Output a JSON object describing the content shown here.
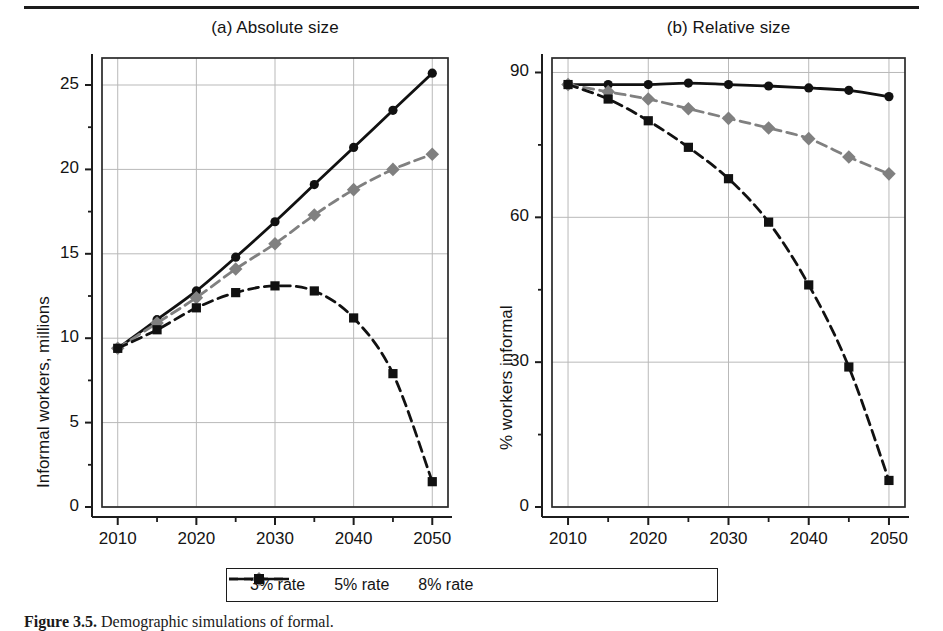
{
  "figure": {
    "caption_prefix": "Figure 3.5.",
    "caption_text": "Demographic simulations of formal."
  },
  "legend": {
    "items": [
      {
        "label": "3% rate",
        "style": "solid",
        "marker": "circle",
        "color": "#111111"
      },
      {
        "label": "5% rate",
        "style": "dashed",
        "marker": "diamond",
        "color": "#808080"
      },
      {
        "label": "8% rate",
        "style": "dashed",
        "marker": "square",
        "color": "#111111"
      }
    ]
  },
  "chart_data": [
    {
      "type": "line",
      "panel": "a",
      "title": "(a) Absolute size",
      "xlabel": "",
      "ylabel": "Informal workers, millions",
      "x": [
        2010,
        2015,
        2020,
        2025,
        2030,
        2035,
        2040,
        2045,
        2050
      ],
      "xticks": [
        "2010",
        "2020",
        "2030",
        "2040",
        "2050"
      ],
      "xtick_values": [
        2010,
        2020,
        2030,
        2040,
        2050
      ],
      "yticks": [
        "0",
        "5",
        "10",
        "15",
        "20",
        "25"
      ],
      "ytick_values": [
        0,
        5,
        10,
        15,
        20,
        25
      ],
      "xlim": [
        2008,
        2052
      ],
      "ylim": [
        0,
        26.6
      ],
      "grid": true,
      "legend_position": "below",
      "series": [
        {
          "name": "3% rate",
          "marker": "circle",
          "style": "solid",
          "color": "#111111",
          "values": [
            9.4,
            11.1,
            12.8,
            14.8,
            16.9,
            19.1,
            21.3,
            23.5,
            25.7
          ]
        },
        {
          "name": "5% rate",
          "marker": "diamond",
          "style": "dashed",
          "color": "#808080",
          "values": [
            9.4,
            10.9,
            12.4,
            14.1,
            15.6,
            17.3,
            18.8,
            20.0,
            20.9
          ]
        },
        {
          "name": "8% rate",
          "marker": "square",
          "style": "dashed",
          "color": "#111111",
          "values": [
            9.4,
            10.5,
            11.8,
            12.7,
            13.1,
            12.8,
            11.2,
            7.9,
            1.5
          ]
        }
      ]
    },
    {
      "type": "line",
      "panel": "b",
      "title": "(b) Relative size",
      "xlabel": "",
      "ylabel": "% workers informal",
      "x": [
        2010,
        2015,
        2020,
        2025,
        2030,
        2035,
        2040,
        2045,
        2050
      ],
      "xticks": [
        "2010",
        "2020",
        "2030",
        "2040",
        "2050"
      ],
      "xtick_values": [
        2010,
        2020,
        2030,
        2040,
        2050
      ],
      "yticks": [
        "0",
        "30",
        "60",
        "90"
      ],
      "ytick_values": [
        0,
        30,
        60,
        90
      ],
      "xlim": [
        2008,
        2052
      ],
      "ylim": [
        0,
        93
      ],
      "grid": true,
      "legend_position": "below",
      "series": [
        {
          "name": "3% rate",
          "marker": "circle",
          "style": "solid",
          "color": "#111111",
          "values": [
            87.5,
            87.5,
            87.5,
            87.8,
            87.5,
            87.2,
            86.8,
            86.3,
            85.0
          ]
        },
        {
          "name": "5% rate",
          "marker": "diamond",
          "style": "dashed",
          "color": "#808080",
          "values": [
            87.5,
            86.0,
            84.5,
            82.5,
            80.5,
            78.5,
            76.3,
            72.5,
            69.0
          ]
        },
        {
          "name": "8% rate",
          "marker": "square",
          "style": "dashed",
          "color": "#111111",
          "values": [
            87.5,
            84.5,
            80.0,
            74.5,
            68.0,
            59.0,
            46.0,
            29.0,
            5.5
          ]
        }
      ]
    }
  ]
}
